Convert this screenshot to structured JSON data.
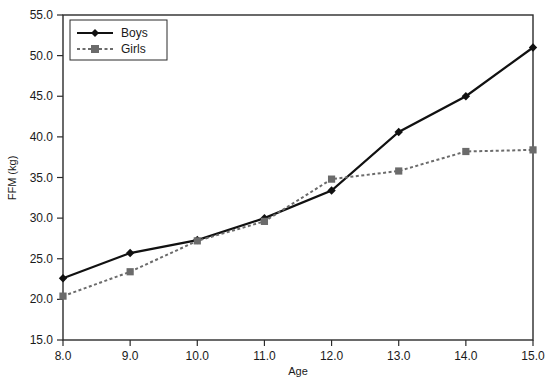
{
  "chart_data": {
    "type": "line",
    "title": "",
    "xlabel": "Age",
    "ylabel": "FFM (kg)",
    "x": [
      8.0,
      9.0,
      10.0,
      11.0,
      12.0,
      13.0,
      14.0,
      15.0
    ],
    "xtick_labels": [
      "8.0",
      "9.0",
      "10.0",
      "11.0",
      "12.0",
      "13.0",
      "14.0",
      "15.0"
    ],
    "ytick_labels": [
      "15.0",
      "20.0",
      "25.0",
      "30.0",
      "35.0",
      "40.0",
      "45.0",
      "50.0",
      "55.0"
    ],
    "yticks": [
      15.0,
      20.0,
      25.0,
      30.0,
      35.0,
      40.0,
      45.0,
      50.0,
      55.0
    ],
    "xlim": [
      8.0,
      15.0
    ],
    "ylim": [
      15.0,
      55.0
    ],
    "grid": false,
    "legend_position": "top-left",
    "series": [
      {
        "name": "Boys",
        "values": [
          22.6,
          25.7,
          27.3,
          30.0,
          33.4,
          40.6,
          45.0,
          51.0
        ],
        "color": "#111111",
        "linestyle": "solid",
        "marker": "diamond"
      },
      {
        "name": "Girls",
        "values": [
          20.4,
          23.4,
          27.2,
          29.6,
          34.8,
          35.8,
          38.2,
          38.4
        ],
        "color": "#6b6b6b",
        "linestyle": "dashed",
        "marker": "square"
      }
    ]
  },
  "legend": {
    "items": [
      {
        "label": "Boys"
      },
      {
        "label": "Girls"
      }
    ]
  },
  "axes": {
    "x_title": "Age",
    "y_title": "FFM (kg)"
  }
}
